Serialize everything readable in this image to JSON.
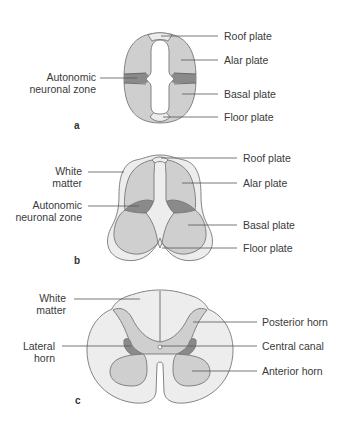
{
  "colors": {
    "plate": "#cfcfcf",
    "autonomic": "#8a8a8a",
    "roof_floor": "#ececec",
    "white_matter": "#ededed",
    "outline": "#777777"
  },
  "panels": [
    {
      "id": "a",
      "letter": "a",
      "labels": {
        "roof_plate": "Roof plate",
        "alar_plate": "Alar plate",
        "autonomic_1": "Autonomic",
        "autonomic_2": "neuronal zone",
        "basal_plate": "Basal plate",
        "floor_plate": "Floor plate"
      }
    },
    {
      "id": "b",
      "letter": "b",
      "labels": {
        "roof_plate": "Roof plate",
        "white_matter_1": "White",
        "white_matter_2": "matter",
        "alar_plate": "Alar plate",
        "autonomic_1": "Autonomic",
        "autonomic_2": "neuronal zone",
        "basal_plate": "Basal plate",
        "floor_plate": "Floor plate"
      }
    },
    {
      "id": "c",
      "letter": "c",
      "labels": {
        "white_matter_1": "White",
        "white_matter_2": "matter",
        "posterior_horn": "Posterior horn",
        "lateral_horn_1": "Lateral",
        "lateral_horn_2": "horn",
        "central_canal": "Central canal",
        "anterior_horn": "Anterior horn"
      }
    }
  ]
}
